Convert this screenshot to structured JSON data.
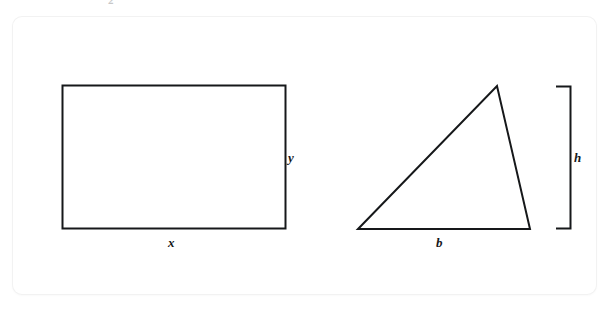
{
  "page": {
    "background_color": "#ffffff",
    "card_color": "#ffffff",
    "ink_color": "#16181a",
    "top_artifact_glyph": "2"
  },
  "figures": [
    {
      "name": "rectangle",
      "shape": "rectangle",
      "labels": [
        {
          "key": "width",
          "text": "x"
        },
        {
          "key": "height",
          "text": "y"
        }
      ]
    },
    {
      "name": "triangle",
      "shape": "triangle",
      "labels": [
        {
          "key": "base",
          "text": "b"
        },
        {
          "key": "height",
          "text": "h"
        }
      ],
      "height_marker": "right-bracket"
    }
  ],
  "labels": {
    "rect_width": "x",
    "rect_height": "y",
    "tri_base": "b",
    "tri_height": "h"
  }
}
